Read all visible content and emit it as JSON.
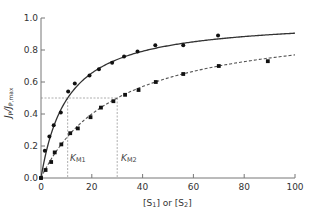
{
  "chart_data": {
    "type": "scatter",
    "title": "",
    "xlabel": "[S1] or [S2]",
    "ylabel": "JP/JP,max",
    "xlim": [
      0,
      100
    ],
    "ylim": [
      0,
      1.0
    ],
    "grid": false,
    "x_ticks": [
      0,
      20,
      40,
      60,
      80,
      100
    ],
    "x_tick_labels": [
      "0",
      "20",
      "40",
      "60",
      "80",
      "100"
    ],
    "y_ticks": [
      0.0,
      0.2,
      0.4,
      0.6,
      0.8,
      1.0
    ],
    "y_tick_labels": [
      "0.0",
      "0.2",
      "0.4",
      "0.6",
      "0.8",
      "1.0"
    ],
    "half_max_line": 0.5,
    "annotations": [
      {
        "text": "KM1",
        "x": 10.5,
        "description": "dotted vertical line where solid curve reaches 0.5"
      },
      {
        "text": "KM2",
        "x": 30,
        "description": "dotted vertical line where dashed curve reaches 0.5"
      }
    ],
    "series": [
      {
        "name": "S1",
        "marker": "circle",
        "line_style": "solid",
        "fit": {
          "model": "michaelis-menten",
          "vmax": 1.0,
          "km": 10.5
        },
        "points": [
          [
            0,
            0.0
          ],
          [
            1.5,
            0.17
          ],
          [
            3.3,
            0.26
          ],
          [
            5,
            0.33
          ],
          [
            7.8,
            0.41
          ],
          [
            10.7,
            0.54
          ],
          [
            13.3,
            0.59
          ],
          [
            19.1,
            0.64
          ],
          [
            22.8,
            0.68
          ],
          [
            28,
            0.72
          ],
          [
            32.7,
            0.76
          ],
          [
            38,
            0.79
          ],
          [
            45,
            0.83
          ],
          [
            56,
            0.83
          ],
          [
            69.7,
            0.89
          ]
        ]
      },
      {
        "name": "S2",
        "marker": "square",
        "line_style": "dashed",
        "fit": {
          "model": "michaelis-menten",
          "vmax": 1.0,
          "km": 30
        },
        "points": [
          [
            0,
            0.0
          ],
          [
            1.8,
            0.05
          ],
          [
            4,
            0.1
          ],
          [
            5.4,
            0.16
          ],
          [
            8,
            0.21
          ],
          [
            11.5,
            0.28
          ],
          [
            14.5,
            0.31
          ],
          [
            19.5,
            0.38
          ],
          [
            23.6,
            0.44
          ],
          [
            28.5,
            0.48
          ],
          [
            33.1,
            0.52
          ],
          [
            38.4,
            0.55
          ],
          [
            45.2,
            0.6
          ],
          [
            56,
            0.65
          ],
          [
            70,
            0.7
          ],
          [
            89.3,
            0.73
          ]
        ]
      }
    ]
  },
  "labels": {
    "xlabel_main": "[S",
    "xlabel_sub1": "1",
    "xlabel_mid": "] or [S",
    "xlabel_sub2": "2",
    "xlabel_end": "]",
    "ylabel_J": "J",
    "ylabel_sub": "P",
    "ylabel_slash": "/J",
    "ylabel_sub2": "P,max",
    "km1_K": "K",
    "km1_sub": "M1",
    "km2_K": "K",
    "km2_sub": "M2"
  }
}
